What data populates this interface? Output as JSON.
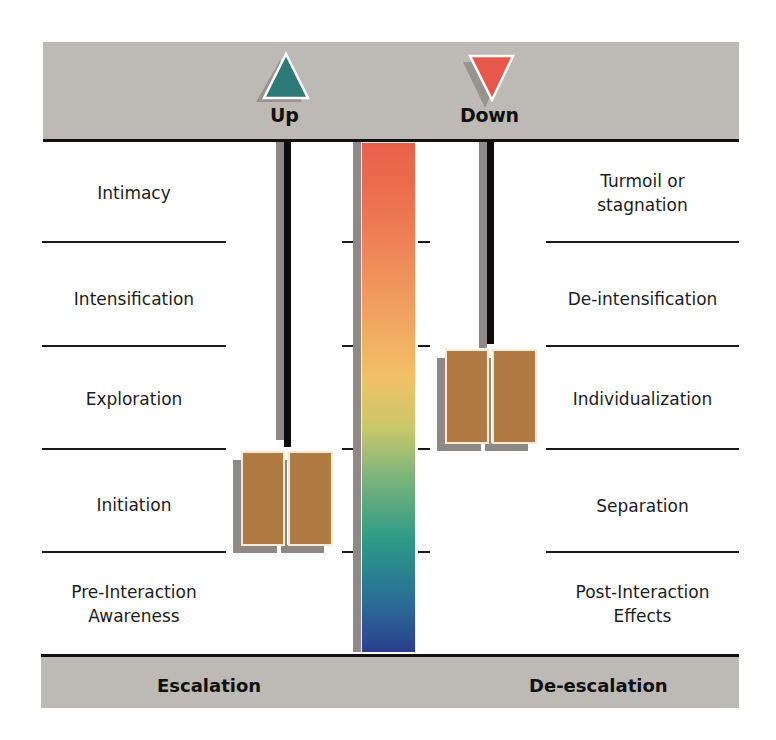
{
  "header": {
    "up": {
      "label": "Up",
      "icon": "triangle-up-icon",
      "color": "#2e7a78"
    },
    "down": {
      "label": "Down",
      "icon": "triangle-down-icon",
      "color": "#e8584a"
    }
  },
  "escalation": {
    "title": "Escalation",
    "stages": [
      {
        "line1": "Intimacy",
        "line2": ""
      },
      {
        "line1": "Intensification",
        "line2": ""
      },
      {
        "line1": "Exploration",
        "line2": ""
      },
      {
        "line1": "Initiation",
        "line2": ""
      },
      {
        "line1": "Pre-Interaction",
        "line2": "Awareness"
      }
    ]
  },
  "deescalation": {
    "title": "De-escalation",
    "stages": [
      {
        "line1": "Turmoil or",
        "line2": "stagnation"
      },
      {
        "line1": "De-intensification",
        "line2": ""
      },
      {
        "line1": "Individualization",
        "line2": ""
      },
      {
        "line1": "Separation",
        "line2": ""
      },
      {
        "line1": "Post-Interaction",
        "line2": "Effects"
      }
    ]
  },
  "colors": {
    "band": "#bdb9b5",
    "box": "#b07a45",
    "gradient_top": "#e9604a",
    "gradient_mid": "#f2c066",
    "gradient_bottom": "#2b3f8e"
  }
}
